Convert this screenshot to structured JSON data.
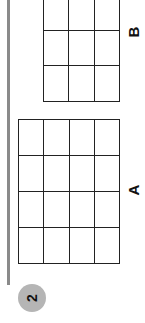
{
  "page": {
    "question_number": "2",
    "figures": [
      {
        "label": "B",
        "rows": 3,
        "columns": 3
      },
      {
        "label": "A",
        "rows": 4,
        "columns": 4
      }
    ]
  },
  "colors": {
    "badge_background": "#b5b5b5",
    "side_bar": "#8a8a8a",
    "grid_lines": "#222222"
  }
}
